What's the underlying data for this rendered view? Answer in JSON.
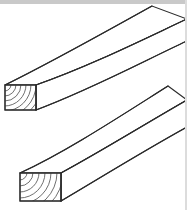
{
  "image": {
    "title": "Two pieces of dimensional lumber in perspective",
    "subject": "lumber-boards",
    "width": 187,
    "height": 210,
    "background_color": "#ffffff",
    "line_color": "#2b2b2b",
    "grain_color": "#4a4a4a",
    "band_color": "#c9c9c9",
    "style": "line-drawing"
  },
  "decorations": {
    "top_band_label": "top-gray-band",
    "right_band_label": "right-gray-band"
  },
  "objects": [
    {
      "id": "upper-board",
      "label": "Upper lumber board",
      "end_face": {
        "label": "end-grain-face",
        "corners": [
          [
            5,
            85
          ],
          [
            36,
            85
          ],
          [
            36,
            110
          ],
          [
            5,
            110
          ]
        ],
        "grain_origin": [
          5,
          85
        ],
        "grain_rings": 7,
        "grain_type": "concentric-arcs"
      },
      "top_face": {
        "label": "top-face",
        "near_left": [
          5,
          85
        ],
        "near_right": [
          36,
          85
        ],
        "recede_vector": [
          130,
          -63
        ]
      },
      "side_face": {
        "label": "front-side-face",
        "near_top": [
          36,
          85
        ],
        "near_bottom": [
          36,
          110
        ],
        "recede_vector": [
          130,
          -63
        ]
      },
      "long_edges": [
        {
          "name": "top-back-edge",
          "from": [
            5,
            85
          ],
          "to": [
            152,
            6
          ],
          "curve_bow": 6
        },
        {
          "name": "top-front-edge",
          "from": [
            36,
            85
          ],
          "to": [
            187,
            19
          ],
          "curve_bow": 6
        },
        {
          "name": "bottom-front-edge",
          "from": [
            36,
            110
          ],
          "to": [
            187,
            41
          ],
          "curve_bow": 6
        }
      ]
    },
    {
      "id": "lower-board",
      "label": "Lower lumber board",
      "end_face": {
        "label": "end-grain-face",
        "corners": [
          [
            20,
            173
          ],
          [
            61,
            173
          ],
          [
            61,
            201
          ],
          [
            20,
            201
          ]
        ],
        "grain_origin": [
          20,
          173
        ],
        "grain_rings": 7,
        "grain_type": "concentric-arcs"
      },
      "top_face": {
        "label": "top-face",
        "near_left": [
          20,
          173
        ],
        "near_right": [
          61,
          173
        ],
        "recede_vector": [
          126,
          -57
        ]
      },
      "side_face": {
        "label": "front-side-face",
        "near_top": [
          61,
          173
        ],
        "near_bottom": [
          61,
          201
        ],
        "recede_vector": [
          126,
          -57
        ]
      },
      "long_edges": [
        {
          "name": "top-back-edge",
          "from": [
            20,
            173
          ],
          "to": [
            168,
            86
          ],
          "curve_bow": 10
        },
        {
          "name": "top-front-edge",
          "from": [
            61,
            173
          ],
          "to": [
            187,
            100
          ],
          "curve_bow": 10
        },
        {
          "name": "bottom-front-edge",
          "from": [
            61,
            201
          ],
          "to": [
            187,
            127
          ],
          "curve_bow": 10
        }
      ]
    }
  ]
}
